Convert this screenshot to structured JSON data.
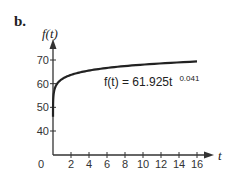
{
  "panel_label": "b.",
  "chart_data": {
    "type": "line",
    "title": "",
    "xlabel": "t",
    "ylabel": "f(t)",
    "xlim": [
      0,
      17
    ],
    "ylim": [
      30,
      75
    ],
    "x_ticks": [
      2,
      4,
      6,
      8,
      10,
      12,
      14,
      16
    ],
    "x_tick_labels": [
      "2",
      "4",
      "6",
      "8",
      "10",
      "12",
      "14",
      "16"
    ],
    "origin_label": "0",
    "y_ticks": [
      40,
      50,
      60,
      70
    ],
    "y_tick_labels": [
      "40",
      "50",
      "60",
      "70"
    ],
    "grid": false,
    "legend": "none",
    "series": [
      {
        "name": "f(t) = 61.925t^0.041",
        "function": {
          "a": 61.925,
          "b": 0.041
        },
        "t_range": [
          0.0007,
          16
        ],
        "color": "#222222"
      }
    ],
    "annotation": {
      "main": "f(t) = 61.925t",
      "exponent": "0.041"
    }
  }
}
